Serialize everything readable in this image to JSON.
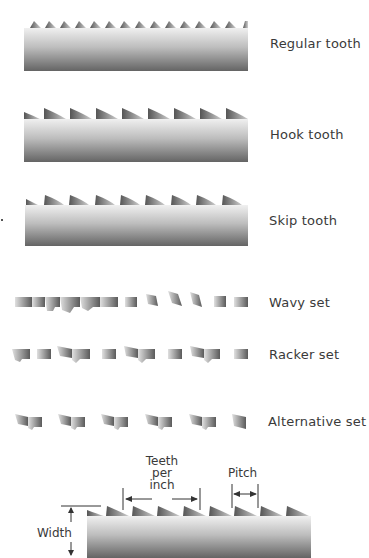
{
  "labels": {
    "regular": "Regular tooth",
    "hook": "Hook tooth",
    "skip": "Skip tooth",
    "wavy": "Wavy set",
    "racker": "Racker set",
    "alternative": "Alternative set"
  },
  "dimension_labels": {
    "teeth_per_inch_1": "Teeth",
    "teeth_per_inch_2": "per",
    "teeth_per_inch_3": "inch",
    "pitch": "Pitch",
    "width": "Width"
  },
  "colors": {
    "blade_light": "#eeeeee",
    "blade_dark": "#6a6a6a",
    "tooth_dark": "#555555",
    "line": "#333333"
  }
}
